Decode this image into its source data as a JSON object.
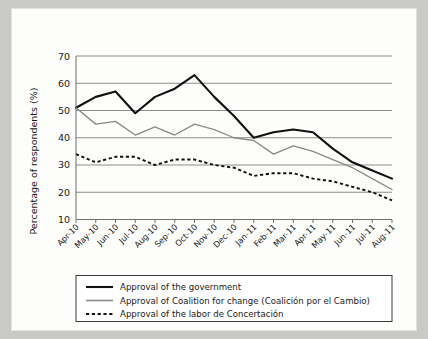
{
  "chart_data": {
    "type": "line",
    "title": "",
    "xlabel": "",
    "ylabel": "Percentage of respondents (%)",
    "ylim": [
      10,
      70
    ],
    "yticks": [
      10,
      20,
      30,
      40,
      50,
      60,
      70
    ],
    "grid": true,
    "legend_position": "bottom",
    "categories": [
      "Apr-10",
      "May-10",
      "Jun-10",
      "Jul-10",
      "Aug-10",
      "Sep-10",
      "Oct-10",
      "Nov-10",
      "Dec-10",
      "Jan-11",
      "Feb-11",
      "Mar-11",
      "Apr-11",
      "May-11",
      "Jun-11",
      "Jul-11",
      "Aug-11"
    ],
    "series": [
      {
        "name": "Approval of the government",
        "color": "#111111",
        "style": "solid",
        "values": [
          51,
          55,
          57,
          49,
          55,
          58,
          63,
          55,
          48,
          40,
          42,
          43,
          42,
          36,
          31,
          28,
          25
        ]
      },
      {
        "name": "Approval of Coalition for change (Coalición por el Cambio)",
        "color": "#8a8a8a",
        "style": "solid",
        "values": [
          51,
          45,
          46,
          41,
          44,
          41,
          45,
          43,
          40,
          39,
          34,
          37,
          35,
          32,
          29,
          25,
          21
        ]
      },
      {
        "name": "Approval of the labor de Concertación",
        "color": "#111111",
        "style": "dashed",
        "values": [
          34,
          31,
          33,
          33,
          30,
          32,
          32,
          30,
          29,
          26,
          27,
          27,
          25,
          24,
          22,
          20,
          17
        ]
      }
    ]
  },
  "legend": {
    "items": [
      {
        "label": "Approval of the government"
      },
      {
        "label": "Approval of Coalition for change (Coalición por el Cambio)"
      },
      {
        "label": "Approval of the labor de Concertación"
      }
    ]
  }
}
